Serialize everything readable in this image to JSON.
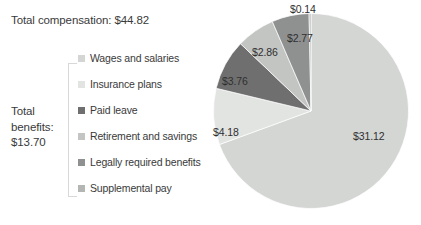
{
  "chart_data": {
    "type": "pie",
    "title": "Total compensation: $44.82",
    "xlabel": "",
    "ylabel": "",
    "legend_position": "left",
    "total": 44.82,
    "currency": "$",
    "categories": [
      "Wages and salaries",
      "Insurance plans",
      "Paid leave",
      "Retirement and savings",
      "Legally required benefits",
      "Supplemental pay"
    ],
    "values": [
      31.12,
      4.18,
      3.76,
      2.86,
      2.77,
      0.14
    ],
    "data_labels": [
      "$31.12",
      "$4.18",
      "$3.76",
      "$2.86",
      "$2.77",
      "$0.14"
    ],
    "colors": [
      "#d4d6d4",
      "#e2e4e2",
      "#6f6f6f",
      "#c3c5c3",
      "#8f9190",
      "#b4b6b4"
    ],
    "annotations": [
      "Total compensation: $44.82",
      "Total benefits: $13.70"
    ]
  },
  "title": {
    "text": "Total compensation: $44.82"
  },
  "benefits_summary": {
    "line1": "Total",
    "line2": "benefits:",
    "line3": "$13.70"
  },
  "legend": {
    "items": [
      {
        "label": "Wages and salaries",
        "color": "#d4d6d4"
      },
      {
        "label": "Insurance plans",
        "color": "#e2e4e2"
      },
      {
        "label": "Paid leave",
        "color": "#6f6f6f"
      },
      {
        "label": "Retirement and savings",
        "color": "#c3c5c3"
      },
      {
        "label": "Legally required benefits",
        "color": "#8f9190"
      },
      {
        "label": "Supplemental pay",
        "color": "#b4b6b4"
      }
    ]
  },
  "pie_labels": [
    {
      "text": "$31.12",
      "left": "140px",
      "top": "117px"
    },
    {
      "text": "$4.18",
      "left": "0px",
      "top": "113px"
    },
    {
      "text": "$3.76",
      "left": "9px",
      "top": "62px"
    },
    {
      "text": "$2.86",
      "left": "39px",
      "top": "33px"
    },
    {
      "text": "$2.77",
      "left": "74px",
      "top": "19px"
    },
    {
      "text": "$0.14",
      "left": "77px",
      "top": "-10px"
    }
  ]
}
